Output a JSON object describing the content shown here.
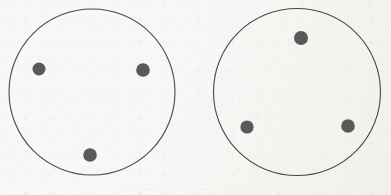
{
  "figure": {
    "background_color": "#f8f7f5",
    "stroke_color": "#4a4a4a",
    "dot_color": "#595959",
    "canvas": {
      "width": 391,
      "height": 195
    },
    "circles": [
      {
        "id": "left-circle",
        "label": "Left circle",
        "cx": 92,
        "cy": 92,
        "r": 83,
        "stroke_width": 1.1,
        "dots": [
          {
            "id": "left-dot-west",
            "label": "Left circle upper-left dot",
            "cx": 39,
            "cy": 69,
            "r": 6.5
          },
          {
            "id": "left-dot-east",
            "label": "Left circle upper-right dot",
            "cx": 143,
            "cy": 70,
            "r": 6.8
          },
          {
            "id": "left-dot-south",
            "label": "Left circle bottom dot",
            "cx": 90,
            "cy": 155,
            "r": 6.8
          }
        ]
      },
      {
        "id": "right-circle",
        "label": "Right circle",
        "cx": 297,
        "cy": 92,
        "r": 83.5,
        "stroke_width": 1.1,
        "dots": [
          {
            "id": "right-dot-north",
            "label": "Right circle top dot",
            "cx": 301,
            "cy": 38,
            "r": 7.0
          },
          {
            "id": "right-dot-southwest",
            "label": "Right circle bottom-left dot",
            "cx": 247,
            "cy": 127,
            "r": 6.6
          },
          {
            "id": "right-dot-southeast",
            "label": "Right circle bottom-right dot",
            "cx": 348,
            "cy": 126,
            "r": 6.8
          }
        ]
      }
    ]
  },
  "caption": {
    "text": "······ ···· ····· ··· ······ ···· ······· ····",
    "visible": true
  }
}
